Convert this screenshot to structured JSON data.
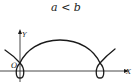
{
  "title": "a < b",
  "axes": {
    "x_label": "X",
    "y_label": "Y",
    "origin_label": "O"
  },
  "colors": {
    "stroke": "#1a1a1a",
    "background": "#ffffff"
  },
  "figure": {
    "type": "prolate cycloid (trochoid)",
    "condition": "a < b",
    "loops": 2
  }
}
